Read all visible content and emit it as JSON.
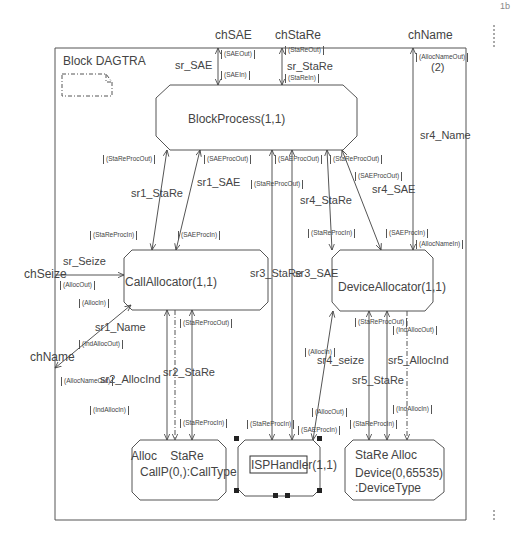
{
  "corner_mark": "1b",
  "block": {
    "title": "Block DAGTRA"
  },
  "channels": {
    "chSAE": "chSAE",
    "chStaRe": "chStaRe",
    "chName_top": "chName",
    "chSeize": "chSeize",
    "chName_left": "chName"
  },
  "processes": {
    "block_process": "BlockProcess(1,1)",
    "call_allocator": "CallAllocator(1,1)",
    "device_allocator": "DeviceAllocator(1,1)",
    "callp": {
      "gates": "Alloc    StaRe",
      "name": "CallP(0,):CallType"
    },
    "isphandler": "ISPHandler(1,1)",
    "device": {
      "gates": "StaRe Alloc",
      "name_line1": "Device(0,65535)",
      "name_line2": ":DeviceType"
    }
  },
  "signal_routes": {
    "sr_SAE": "sr_SAE",
    "sr_StaRe": "sr_StaRe",
    "sr1_StaRe": "sr1_StaRe",
    "sr1_SAE": "sr1_SAE",
    "sr4_StaRe": "sr4_StaRe",
    "sr4_SAE": "sr4_SAE",
    "sr4_Name": "sr4_Name",
    "sr_Seize": "sr_Seize",
    "sr1_Name": "sr1_Name",
    "sr2_AllocInd": "sr2_AllocInd",
    "sr2_StaRe": "sr2_StaRe",
    "sr3_StaRe": "sr3_StaRe",
    "sr3_SAE": "sr3_SAE",
    "sr4_seize": "sr4_seize",
    "sr5_StaRe": "sr5_StaRe",
    "sr5_AllocInd": "sr5_AllocInd",
    "multiplicity": "(2)"
  },
  "signals": {
    "SAEOut": "(SAEOut)",
    "SAEIn": "(SAEIn)",
    "StaReOut": "(StaReOut)",
    "StaReIn": "(StaReIn)",
    "AllocNameOut_top": "(AllocNameOut)",
    "StaReProcOut_1": "(StaReProcOut)",
    "SAEProcOut_1": "(SAEProcOut)",
    "StaReProcOut_2": "(StaReProcOut)",
    "SAEProcOut_2": "(SAEProcOut)",
    "StaReProcOut_3": "(StaReProcOut)",
    "SAEProcOut_3": "(SAEProcOut)",
    "StaReProcIn_1": "(StaReProcIn)",
    "SAEProcIn_1": "(SAEProcIn)",
    "StaReProcIn_4": "(StaReProcIn)",
    "SAEProcIn_4": "(SAEProcIn)",
    "AllocNameIn": "(AllocNameIn)",
    "AllocOut_left": "(AllocOut)",
    "AllocIn_left": "(AllocIn)",
    "IndAllocOut_left": "(IndAllocOut)",
    "AllocNameOut_left": "(AllocNameOut)",
    "StaReProcOut_2b": "(StaReProcOut)",
    "IndAllocIn_1": "(IndAllocIn)",
    "StaReProcIn_2": "(StaReProcIn)",
    "StaReProcIn_3": "(StaReProcIn)",
    "SAEProcIn_3": "(SAEProcIn)",
    "AllocIn_4": "(AllocIn)",
    "AllocOut_4": "(AllocOut)",
    "StaReProcOut_5": "(StaReProcOut)",
    "IndAllocOut_5": "(IndAllocOut)",
    "StaReProcIn_5": "(StaReProcIn)",
    "IndAllocIn_5": "(IndAllocIn)",
    "AllocIn_5": "(AllocIn)"
  }
}
